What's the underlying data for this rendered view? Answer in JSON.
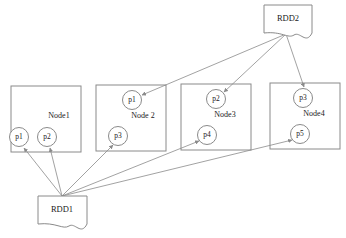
{
  "diagram": {
    "type": "node-partition-graph",
    "colors": {
      "stroke": "#8a8a8a",
      "text": "#1a1a1a",
      "background": "#ffffff"
    },
    "sources": [
      {
        "id": "rdd1",
        "label": "RDD1",
        "shape": "document",
        "x": 38,
        "y": 196,
        "width": 49,
        "height": 29,
        "anchor_x": 62,
        "anchor_y": 196
      },
      {
        "id": "rdd2",
        "label": "RDD2",
        "shape": "document",
        "x": 264,
        "y": 5,
        "width": 48,
        "height": 28,
        "anchor_x": 286,
        "anchor_y": 34
      }
    ],
    "nodes": [
      {
        "id": "node1",
        "label": "Node1",
        "x": 11,
        "y": 86,
        "width": 70,
        "height": 66,
        "label_x": 59,
        "label_y": 116,
        "partitions": [
          {
            "id": "n1p1",
            "label": "p1",
            "cx": 19,
            "cy": 137,
            "r": 9.5,
            "source": "rdd1"
          },
          {
            "id": "n1p2",
            "label": "p2",
            "cx": 47,
            "cy": 137,
            "r": 9.5,
            "source": "rdd1"
          }
        ]
      },
      {
        "id": "node2",
        "label": "Node 2",
        "x": 96,
        "y": 85,
        "width": 70,
        "height": 66,
        "label_x": 143,
        "label_y": 116,
        "partitions": [
          {
            "id": "n2p1",
            "label": "p1",
            "cx": 132,
            "cy": 100,
            "r": 9.5,
            "source": "rdd2"
          },
          {
            "id": "n2p3",
            "label": "p3",
            "cx": 118,
            "cy": 136,
            "r": 9.5,
            "source": "rdd1"
          }
        ]
      },
      {
        "id": "node3",
        "label": "Node3",
        "x": 181,
        "y": 84,
        "width": 70,
        "height": 66,
        "label_x": 225,
        "label_y": 115,
        "partitions": [
          {
            "id": "n3p2",
            "label": "p2",
            "cx": 216,
            "cy": 99,
            "r": 9.5,
            "source": "rdd2"
          },
          {
            "id": "n3p4",
            "label": "p4",
            "cx": 207,
            "cy": 135,
            "r": 9.5,
            "source": "rdd1"
          }
        ]
      },
      {
        "id": "node4",
        "label": "Node4",
        "x": 270,
        "y": 83,
        "width": 70,
        "height": 66,
        "label_x": 314,
        "label_y": 114,
        "partitions": [
          {
            "id": "n4p3",
            "label": "p3",
            "cx": 303,
            "cy": 98,
            "r": 9.5,
            "source": "rdd2"
          },
          {
            "id": "n4p5",
            "label": "p5",
            "cx": 300,
            "cy": 134,
            "r": 9.5,
            "source": "rdd1"
          }
        ]
      }
    ],
    "edges": [
      {
        "id": "e-rdd1-n1p1",
        "from": "rdd1",
        "to": "n1p1",
        "x1": 62,
        "y1": 196,
        "x2": 24,
        "y2": 147
      },
      {
        "id": "e-rdd1-n1p2",
        "from": "rdd1",
        "to": "n1p2",
        "x1": 62,
        "y1": 196,
        "x2": 50,
        "y2": 147
      },
      {
        "id": "e-rdd1-n2p3",
        "from": "rdd1",
        "to": "n2p3",
        "x1": 62,
        "y1": 196,
        "x2": 113,
        "y2": 145
      },
      {
        "id": "e-rdd1-n3p4",
        "from": "rdd1",
        "to": "n3p4",
        "x1": 62,
        "y1": 196,
        "x2": 199,
        "y2": 141
      },
      {
        "id": "e-rdd1-n4p5",
        "from": "rdd1",
        "to": "n4p5",
        "x1": 62,
        "y1": 196,
        "x2": 292,
        "y2": 140
      },
      {
        "id": "e-rdd2-n2p1",
        "from": "rdd2",
        "to": "n2p1",
        "x1": 286,
        "y1": 34,
        "x2": 142,
        "y2": 95
      },
      {
        "id": "e-rdd2-n3p2",
        "from": "rdd2",
        "to": "n3p2",
        "x1": 286,
        "y1": 34,
        "x2": 224,
        "y2": 92
      },
      {
        "id": "e-rdd2-n4p3",
        "from": "rdd2",
        "to": "n4p3",
        "x1": 286,
        "y1": 34,
        "x2": 304,
        "y2": 88
      }
    ]
  }
}
